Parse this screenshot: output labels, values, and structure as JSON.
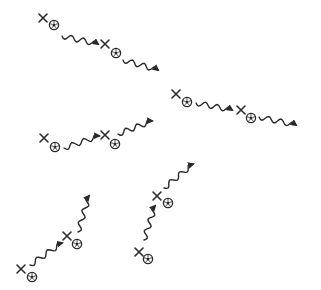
{
  "diagram": {
    "type": "soccer-dribbling-drill",
    "background": "#ffffff",
    "ink_color": "#2a2a2a",
    "players": [
      {
        "id": "p1",
        "x": 43,
        "y": 18,
        "ball": [
          54,
          25
        ]
      },
      {
        "id": "p2",
        "x": 105,
        "y": 44,
        "ball": [
          116,
          53
        ]
      },
      {
        "id": "p3",
        "x": 176,
        "y": 94,
        "ball": [
          187,
          102
        ]
      },
      {
        "id": "p4",
        "x": 241,
        "y": 110,
        "ball": [
          251,
          118
        ]
      },
      {
        "id": "p5",
        "x": 44,
        "y": 138,
        "ball": [
          55,
          147
        ]
      },
      {
        "id": "p6",
        "x": 105,
        "y": 135,
        "ball": [
          115,
          144
        ]
      },
      {
        "id": "p7",
        "x": 67,
        "y": 236,
        "ball": [
          77,
          244
        ]
      },
      {
        "id": "p8",
        "x": 21,
        "y": 269,
        "ball": [
          32,
          277
        ]
      },
      {
        "id": "p9",
        "x": 157,
        "y": 196,
        "ball": [
          168,
          203
        ]
      },
      {
        "id": "p10",
        "x": 139,
        "y": 252,
        "ball": [
          148,
          259
        ]
      }
    ],
    "dribbles": [
      {
        "id": "d1",
        "from": [
          62,
          36
        ],
        "to": [
          98,
          44
        ]
      },
      {
        "id": "d2",
        "from": [
          123,
          60
        ],
        "to": [
          158,
          70
        ]
      },
      {
        "id": "d3",
        "from": [
          196,
          103
        ],
        "to": [
          232,
          110
        ]
      },
      {
        "id": "d4",
        "from": [
          259,
          117
        ],
        "to": [
          296,
          125
        ]
      },
      {
        "id": "d5",
        "from": [
          64,
          148
        ],
        "to": [
          99,
          136
        ]
      },
      {
        "id": "d6",
        "from": [
          118,
          134
        ],
        "to": [
          152,
          121
        ]
      },
      {
        "id": "d7",
        "from": [
          30,
          265
        ],
        "to": [
          62,
          243
        ]
      },
      {
        "id": "d8",
        "from": [
          78,
          232
        ],
        "to": [
          89,
          196
        ]
      },
      {
        "id": "d9",
        "from": [
          144,
          240
        ],
        "to": [
          155,
          206
        ]
      },
      {
        "id": "d10",
        "from": [
          164,
          188
        ],
        "to": [
          193,
          164
        ]
      }
    ]
  }
}
